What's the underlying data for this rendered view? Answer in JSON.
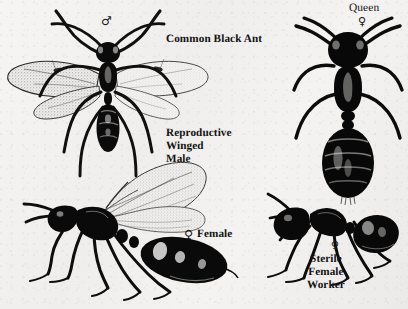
{
  "plate": {
    "title": "Common Black Ant",
    "background_color": "#f3f2f0",
    "ink_color": "#121212"
  },
  "labels": {
    "common_black_ant": "Common Black Ant",
    "reproductive_winged_male": "Reproductive\nWinged\nMale",
    "female": "Female",
    "queen": "Queen",
    "sterile_female_worker": "Sterile\nFemale\nWorker"
  },
  "symbols": {
    "male": "♂",
    "female_alate": "♀",
    "female_queen": "♀",
    "female_worker": "♀"
  },
  "figures": [
    {
      "name": "winged-male-dorsal",
      "caste": "Reproductive Winged Male",
      "view": "dorsal",
      "symbol": "♂",
      "wings": true
    },
    {
      "name": "winged-female-lateral",
      "caste": "Female",
      "view": "lateral",
      "symbol": "♀",
      "wings": true
    },
    {
      "name": "queen-dorsal",
      "caste": "Queen",
      "view": "dorsal",
      "symbol": "♀",
      "wings": false
    },
    {
      "name": "sterile-female-worker-lateral",
      "caste": "Sterile Female Worker",
      "view": "lateral",
      "symbol": "♀",
      "wings": false
    }
  ]
}
